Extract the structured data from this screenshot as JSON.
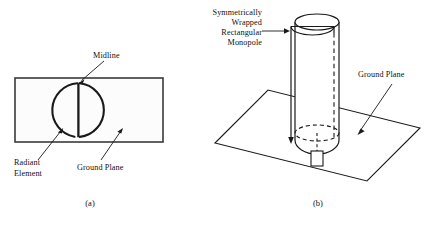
{
  "figure": {
    "background_color": "#ffffff",
    "line_color": "#1a1a1a",
    "panels": [
      {
        "id": "a",
        "caption": "(a)",
        "view": "top view",
        "labels": {
          "midline": "Midline",
          "radiant_element_line1": "Radiant",
          "radiant_element_line2": "Element",
          "ground_plane": "Ground Plane"
        },
        "shapes": {
          "ground_plane_rect": {
            "x": 15,
            "y": 78,
            "width": 148,
            "height": 64
          },
          "radiant_circle": {
            "cx": 78,
            "cy": 110,
            "r": 27
          },
          "midline_segment": {
            "x": 78,
            "y1": 83,
            "y2": 137
          }
        }
      },
      {
        "id": "b",
        "caption": "(b)",
        "view": "perspective view",
        "labels": {
          "monopole_line1": "Symmetrically",
          "monopole_line2": "Wrapped",
          "monopole_line3": "Rectangular",
          "monopole_line4": "Monopole",
          "ground_plane": "Ground Plane"
        },
        "shapes": {
          "ground_plane_parallelogram": [
            [
              215,
              143
            ],
            [
              268,
              90
            ],
            [
              420,
              128
            ],
            [
              367,
              181
            ]
          ],
          "cylinder": {
            "cx": 317,
            "top_cy": 22,
            "rx": 22,
            "ry": 8,
            "bottom_cy": 148
          },
          "feed_pin": {
            "x": 311,
            "y": 152,
            "width": 12,
            "height": 14
          }
        }
      }
    ]
  }
}
